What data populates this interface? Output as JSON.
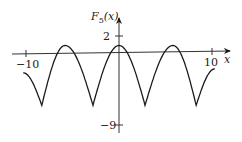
{
  "chart_data": {
    "type": "line",
    "title": "",
    "xlabel": "x",
    "ylabel": "F5(x)",
    "ylabel_main": "F",
    "ylabel_sub": "5",
    "ylabel_arg": "(x)",
    "x_ticks": [
      {
        "value": -10,
        "label": "−10"
      },
      {
        "value": 10,
        "label": "10"
      }
    ],
    "y_ticks": [
      {
        "value": 2,
        "label": "2"
      },
      {
        "value": -9,
        "label": "−9"
      }
    ],
    "xlim": [
      -10.3,
      10.3
    ],
    "ylim": [
      -9,
      2
    ],
    "grid": false,
    "legend": null,
    "series": [
      {
        "name": "F5(x)",
        "x": [
          -10.3,
          -8.3,
          -5.8,
          -2.8,
          0,
          2.8,
          5.8,
          8.3,
          10.3
        ],
        "y": [
          -3.2,
          -8.2,
          1.0,
          -8.2,
          1.0,
          -8.2,
          1.0,
          -8.2,
          -2.6
        ]
      }
    ],
    "color": "#1a1a1a"
  }
}
